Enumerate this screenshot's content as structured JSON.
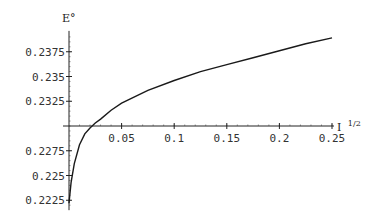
{
  "chart_data": {
    "type": "line",
    "title": "",
    "xlabel": "I^{1/2}",
    "ylabel": "E°",
    "xlabel_base": "I",
    "xlabel_sup": "1/2",
    "xlim": [
      0,
      0.25
    ],
    "ylim": [
      0.2218,
      0.239
    ],
    "axis_crossing_y": 0.23,
    "grid": false,
    "legend": null,
    "x_ticks": [
      0.05,
      0.1,
      0.15,
      0.2,
      0.25
    ],
    "x_tick_labels": [
      "0.05",
      "0.1",
      "0.15",
      "0.2",
      "0.25"
    ],
    "y_ticks": [
      0.2375,
      0.235,
      0.2325,
      0.2275,
      0.225,
      0.2225
    ],
    "y_tick_labels": [
      "0.2375",
      "0.235",
      "0.2325",
      "0.2275",
      "0.225",
      "0.2225"
    ],
    "series": [
      {
        "name": "E°",
        "x": [
          0.0,
          0.002,
          0.005,
          0.01,
          0.015,
          0.02,
          0.025,
          0.03,
          0.04,
          0.05,
          0.075,
          0.1,
          0.125,
          0.15,
          0.175,
          0.2,
          0.225,
          0.25
        ],
        "values": [
          0.2222,
          0.2243,
          0.2262,
          0.2281,
          0.2292,
          0.2298,
          0.2303,
          0.2307,
          0.2316,
          0.2323,
          0.2336,
          0.2346,
          0.2355,
          0.2362,
          0.2369,
          0.2376,
          0.2383,
          0.2389
        ]
      }
    ],
    "color": "#1a1a1a"
  }
}
